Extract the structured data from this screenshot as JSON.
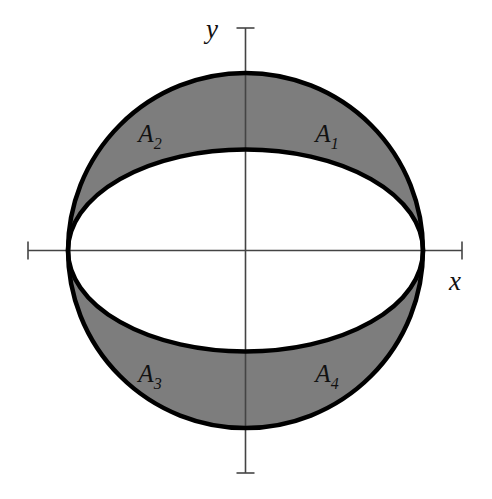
{
  "figure": {
    "background_color": "#ffffff",
    "width": 492,
    "height": 499
  },
  "axes": {
    "origin": {
      "x": 245.5,
      "y": 250.5
    },
    "line_color": "#444444",
    "line_width": 1.6,
    "x_axis": {
      "label": "x",
      "label_x": 455,
      "label_y": 290,
      "start_x": 28,
      "end_x": 462,
      "y": 250.5,
      "tick_half_length": 9
    },
    "y_axis": {
      "label": "y",
      "label_x": 212,
      "label_y": 38,
      "x": 245.5,
      "start_y": 28,
      "end_y": 473,
      "tick_half_length": 9
    }
  },
  "shapes": {
    "circle": {
      "name": "outer-circle",
      "cx": 245.5,
      "cy": 250.5,
      "r": 177.5,
      "stroke_color": "#000000",
      "stroke_width": 4.5,
      "fill": "none"
    },
    "ellipse": {
      "name": "inner-ellipse",
      "cx": 245.5,
      "cy": 250.5,
      "rx": 177.5,
      "ry": 101,
      "stroke_color": "#000000",
      "stroke_width": 4.5,
      "fill": "#ffffff"
    },
    "shaded_fill_color": "#7d7d7d"
  },
  "regions": [
    {
      "id": "A1",
      "base": "A",
      "subscript": "1",
      "quadrant": "upper-right",
      "label_x": 327,
      "label_y": 142
    },
    {
      "id": "A2",
      "base": "A",
      "subscript": "2",
      "quadrant": "upper-left",
      "label_x": 150,
      "label_y": 142
    },
    {
      "id": "A3",
      "base": "A",
      "subscript": "3",
      "quadrant": "lower-left",
      "label_x": 150,
      "label_y": 382
    },
    {
      "id": "A4",
      "base": "A",
      "subscript": "4",
      "quadrant": "lower-right",
      "label_x": 327,
      "label_y": 382
    }
  ]
}
